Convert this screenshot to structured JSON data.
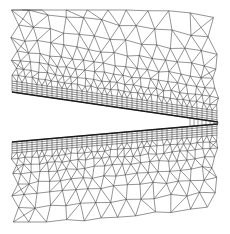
{
  "figure": {
    "type": "computational-mesh",
    "width": 230,
    "height": 234,
    "colors": {
      "background": "#ffffff",
      "edge": "#3a3a3a",
      "surface": "#1a1a1a"
    },
    "extent": {
      "x0": 12,
      "x1": 218,
      "y0": 10,
      "y1": 222
    },
    "upper_surface": {
      "x0": 12,
      "y0": 92,
      "x1": 218,
      "y1": 122
    },
    "lower_surface": {
      "x0": 12,
      "y0": 142,
      "x1": 218,
      "y1": 124
    },
    "trailing_edge": {
      "x": 190,
      "y": 124
    },
    "boundary_layers": 5,
    "layer_spacing": 2.2
  }
}
